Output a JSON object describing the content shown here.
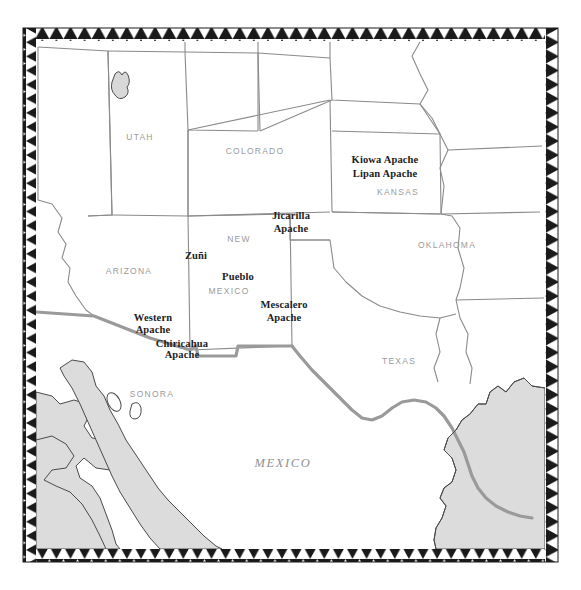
{
  "figure": {
    "kind": "historical-reference-map",
    "title_visible": false,
    "width": 581,
    "height": 590
  },
  "colors": {
    "page_background": "#ffffff",
    "land_fill": "#ffffff",
    "water_fill": "#dcdcdc",
    "water_outline": "#4a4a4a",
    "state_border": "#8a8a8a",
    "international_border": "#9a9a9a",
    "frame_black": "#1a1a1a",
    "frame_white": "#ffffff",
    "state_label": "#9a9a9a",
    "country_label": "#8f8f8f",
    "tribe_label": "#1c1c1c"
  },
  "frame": {
    "name": "sawtooth-triangle-border",
    "band_width_px": 13,
    "triangle_count_top": 34,
    "triangle_count_side": 35,
    "description": "black band with white triangles pointing inward"
  },
  "map": {
    "state_labels": [
      {
        "text": "UTAH",
        "x": 140,
        "y": 138
      },
      {
        "text": "COLORADO",
        "x": 255,
        "y": 152
      },
      {
        "text": "KANSAS",
        "x": 398,
        "y": 193
      },
      {
        "text": "OKLAHOMA",
        "x": 447,
        "y": 246
      },
      {
        "text": "ARIZONA",
        "x": 129,
        "y": 272
      },
      {
        "text": "NEW",
        "x": 239,
        "y": 240
      },
      {
        "text": "MEXICO",
        "x": 229,
        "y": 292
      },
      {
        "text": "TEXAS",
        "x": 399,
        "y": 362
      },
      {
        "text": "SONORA",
        "x": 152,
        "y": 395
      }
    ],
    "country_labels": [
      {
        "text": "MEXICO",
        "x": 283,
        "y": 463
      }
    ],
    "tribe_labels": [
      {
        "text": "Kiowa Apache",
        "x": 385,
        "y": 160
      },
      {
        "text": "Lipan Apache",
        "x": 385,
        "y": 174
      },
      {
        "text": "Jicarilla",
        "x": 291,
        "y": 216
      },
      {
        "text": "Apache",
        "x": 291,
        "y": 229
      },
      {
        "text": "Zuñi",
        "x": 196,
        "y": 256
      },
      {
        "text": "Pueblo",
        "x": 238,
        "y": 277
      },
      {
        "text": "Mescalero",
        "x": 284,
        "y": 305
      },
      {
        "text": "Apache",
        "x": 284,
        "y": 318
      },
      {
        "text": "Western",
        "x": 153,
        "y": 318
      },
      {
        "text": "Apache",
        "x": 153,
        "y": 330
      },
      {
        "text": "Chiricahua",
        "x": 182,
        "y": 344
      },
      {
        "text": "Apache",
        "x": 182,
        "y": 355
      }
    ],
    "water_bodies": [
      {
        "name": "great-salt-lake",
        "x": 122,
        "y": 88
      },
      {
        "name": "pacific-ocean",
        "x": 70,
        "y": 450
      },
      {
        "name": "gulf-of-california",
        "x": 150,
        "y": 450
      },
      {
        "name": "gulf-of-mexico",
        "x": 500,
        "y": 450
      }
    ],
    "region_outlines": [
      "utah",
      "colorado",
      "wyoming",
      "nebraska",
      "kansas",
      "oklahoma",
      "arizona",
      "new-mexico",
      "texas",
      "nevada",
      "california",
      "idaho",
      "south-dakota",
      "missouri",
      "arkansas",
      "louisiana",
      "mexico"
    ]
  }
}
